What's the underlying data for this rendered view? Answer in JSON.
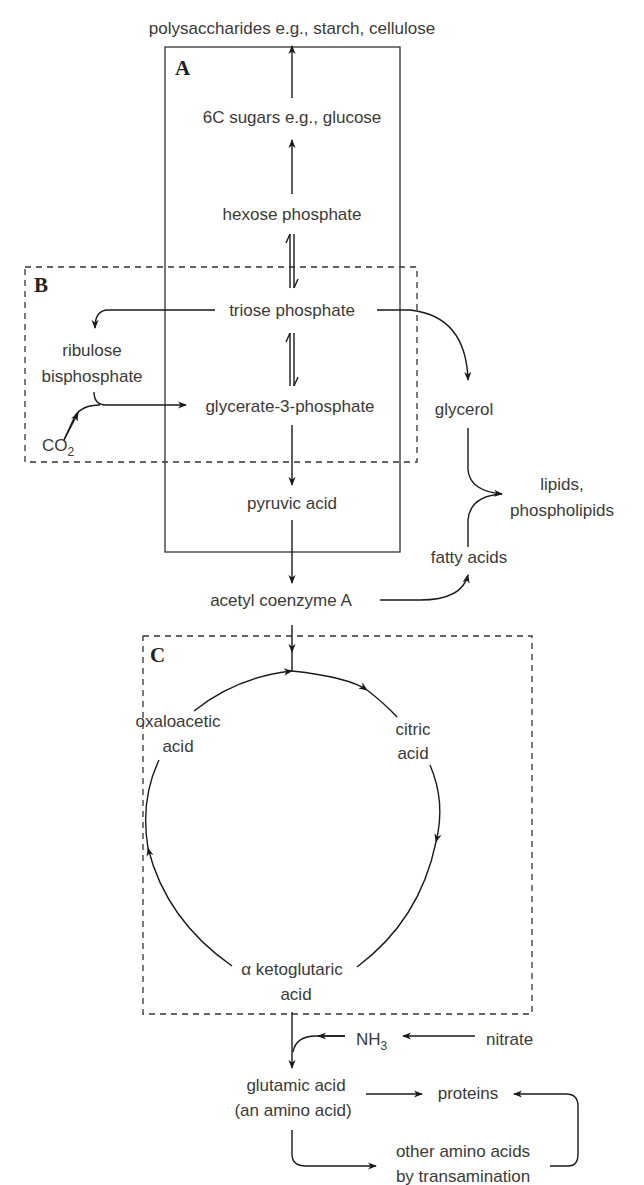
{
  "diagram": {
    "boxes": {
      "A": "A",
      "B": "B",
      "C": "C"
    },
    "nodes": {
      "polysaccharides": "polysaccharides e.g., starch, cellulose",
      "sugars6c": "6C sugars e.g., glucose",
      "hexose_phosphate": "hexose phosphate",
      "triose_phosphate": "triose phosphate",
      "ribulose_1": "ribulose",
      "ribulose_2": "bisphosphate",
      "co2_main": "CO",
      "co2_sub": "2",
      "glycerate": "glycerate-3-phosphate",
      "glycerol": "glycerol",
      "lipids_1": "lipids,",
      "lipids_2": "phospholipids",
      "pyruvic_acid": "pyruvic acid",
      "fatty_acids": "fatty acids",
      "acetyl_coa": "acetyl coenzyme A",
      "oxaloacetic_1": "oxaloacetic",
      "oxaloacetic_2": "acid",
      "citric_1": "citric",
      "citric_2": "acid",
      "ketoglutaric_1": "α ketoglutaric",
      "ketoglutaric_2": "acid",
      "nh3_main": "NH",
      "nh3_sub": "3",
      "nitrate": "nitrate",
      "glutamic_1": "glutamic acid",
      "glutamic_2": "(an amino acid)",
      "proteins": "proteins",
      "other_aa_1": "other amino acids",
      "other_aa_2": "by transamination"
    }
  }
}
